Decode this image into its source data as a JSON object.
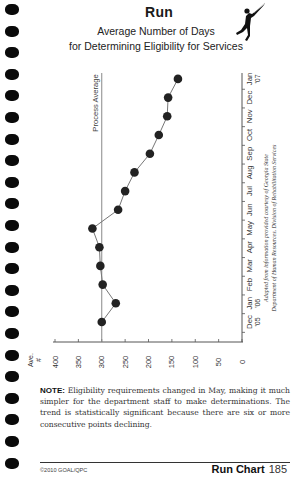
{
  "page": {
    "title": "Run",
    "subtitle_line1": "Average Number of Days",
    "subtitle_line2": "for Determining Eligibility for Services",
    "icon": "runner-figure-icon",
    "binding_holes": 22
  },
  "note": {
    "label": "NOTE:",
    "text": " Eligibility requirements changed in May, making it much simpler for the department staff to make determinations. The trend is statistically significant because there are six or more consecutive points declining."
  },
  "footer": {
    "copyright": "©2010 GOAL/QPC",
    "section": "Run Chart",
    "page_number": "185"
  },
  "chart_data": {
    "type": "line",
    "orientation": "rotated 90° (time axis vertical, value axis horizontal)",
    "title": "Average Number of Days for Determining Eligibility for Services",
    "xlabel": "",
    "ylabel": "Ave. #",
    "categories": [
      "Dec '05",
      "Jan '06",
      "Feb",
      "Mar",
      "Apr",
      "May",
      "Jun",
      "Jul",
      "Aug",
      "Sep",
      "Oct",
      "Nov",
      "Dec",
      "Jan '07"
    ],
    "category_labels": [
      {
        "main": "Dec",
        "sub": "'05"
      },
      {
        "main": "Jan",
        "sub": "'06"
      },
      {
        "main": "Feb",
        "sub": ""
      },
      {
        "main": "Mar",
        "sub": ""
      },
      {
        "main": "Apr",
        "sub": ""
      },
      {
        "main": "May",
        "sub": ""
      },
      {
        "main": "Jun",
        "sub": ""
      },
      {
        "main": "Jul",
        "sub": ""
      },
      {
        "main": "Aug",
        "sub": ""
      },
      {
        "main": "Sep",
        "sub": ""
      },
      {
        "main": "Oct",
        "sub": ""
      },
      {
        "main": "Nov",
        "sub": ""
      },
      {
        "main": "Dec",
        "sub": ""
      },
      {
        "main": "Jan",
        "sub": "'07"
      }
    ],
    "series": [
      {
        "name": "Average Number of Days",
        "values": [
          300,
          270,
          298,
          303,
          305,
          320,
          265,
          250,
          230,
          197,
          178,
          160,
          158,
          137
        ]
      }
    ],
    "reference_line": {
      "label": "Process Average",
      "value": 300
    },
    "ylim": [
      0,
      400
    ],
    "yticks": [
      400,
      350,
      300,
      250,
      200,
      150,
      100,
      50,
      0
    ],
    "grid": false,
    "legend": null,
    "annotation_line1": "Adapted from information provided courtesy of Georgia State",
    "annotation_line2": "Department of Human Resources, Division of Rehabilitation Services"
  },
  "colors": {
    "ink": "#1a1a1a",
    "axis": "#555555",
    "line": "#777777",
    "marker": "#222222"
  }
}
